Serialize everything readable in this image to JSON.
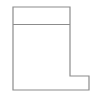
{
  "canvas": {
    "width": 102,
    "height": 98,
    "background_color": "#ffffff"
  },
  "figure": {
    "name": "boot-shaped-outline",
    "stroke_color": "#8c8c8c",
    "stroke_width": 1.2,
    "fill_color": "#ffffff",
    "outline_points": "13,7 70,7 70,76 89,76 89,90 13,90",
    "divider_line": {
      "name": "interior-horizontal-divider",
      "x1": 13,
      "y1": 24.5,
      "x2": 70,
      "y2": 24.5
    },
    "vertices": [
      {
        "label": "top-left",
        "x": 13,
        "y": 7
      },
      {
        "label": "top-right",
        "x": 70,
        "y": 7
      },
      {
        "label": "inner-step-top",
        "x": 70,
        "y": 76
      },
      {
        "label": "outer-step-top",
        "x": 89,
        "y": 76
      },
      {
        "label": "bottom-right",
        "x": 89,
        "y": 90
      },
      {
        "label": "bottom-left",
        "x": 13,
        "y": 90
      }
    ]
  }
}
